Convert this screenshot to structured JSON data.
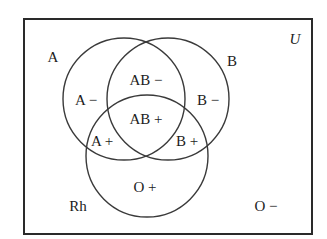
{
  "diagram": {
    "type": "venn",
    "universe_label": "U",
    "sets": [
      {
        "id": "A",
        "label": "A"
      },
      {
        "id": "B",
        "label": "B"
      },
      {
        "id": "Rh",
        "label": "Rh"
      }
    ],
    "regions": {
      "a_only": "A −",
      "ab_only": "AB −",
      "b_only": "B −",
      "a_rh": "A +",
      "ab_rh": "AB +",
      "b_rh": "B +",
      "rh_only": "O +",
      "none": "O −"
    },
    "colors": {
      "stroke": "#3a3a3a",
      "text": "#1c1c1c",
      "background": "#ffffff"
    }
  }
}
